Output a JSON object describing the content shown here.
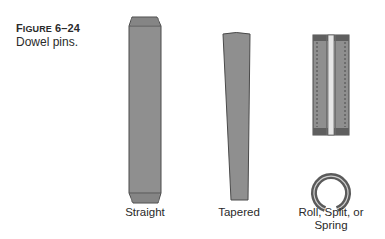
{
  "figure": {
    "number_prefix": "F",
    "number_prefix_rest": "IGURE",
    "number": "6–24",
    "title": "Dowel pins."
  },
  "pins": [
    {
      "id": "straight",
      "label": "Straight"
    },
    {
      "id": "tapered",
      "label": "Tapered"
    },
    {
      "id": "roll",
      "label_line1": "Roll, Split, or",
      "label_line2": "Spring"
    }
  ],
  "colors": {
    "pin_fill": "#8e8e8e",
    "pin_dark": "#5f5f5f",
    "pin_outline": "#4a4a4a",
    "slot_light": "#e6e6e6",
    "background": "#ffffff"
  }
}
